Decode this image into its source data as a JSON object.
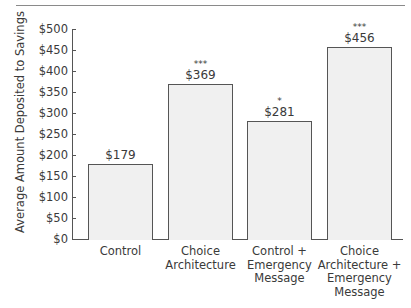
{
  "chart_data": {
    "type": "bar",
    "title": "",
    "xlabel": "",
    "ylabel": "Average Amount Deposited to Savings",
    "ylim": [
      0,
      500
    ],
    "yticks": [
      "$0",
      "$50",
      "$100",
      "$150",
      "$200",
      "$250",
      "$300",
      "$350",
      "$400",
      "$450",
      "$500"
    ],
    "categories": [
      "Control",
      "Choice\nArchitecture",
      "Control +\nEmergency\nMessage",
      "Choice\nArchitecture +\nEmergency\nMessage"
    ],
    "values": [
      179,
      369,
      281,
      456
    ],
    "value_labels": [
      "$179",
      "$369",
      "$281",
      "$456"
    ],
    "significance": [
      "",
      "***",
      "*",
      "***"
    ],
    "grid": false,
    "legend": null,
    "bar_color": "#f0f0f0",
    "edge_color": "#555555"
  },
  "axis": {
    "ylabel": "Average Amount Deposited to Savings",
    "ticks": [
      "$0",
      "$50",
      "$100",
      "$150",
      "$200",
      "$250",
      "$300",
      "$350",
      "$400",
      "$450",
      "$500"
    ]
  },
  "bars": [
    {
      "label": "Control",
      "value_label": "$179",
      "sig": ""
    },
    {
      "label": "Choice\nArchitecture",
      "value_label": "$369",
      "sig": "***"
    },
    {
      "label": "Control +\nEmergency\nMessage",
      "value_label": "$281",
      "sig": "*"
    },
    {
      "label": "Choice\nArchitecture +\nEmergency\nMessage",
      "value_label": "$456",
      "sig": "***"
    }
  ]
}
